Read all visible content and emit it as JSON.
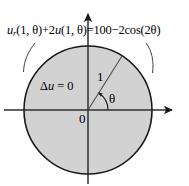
{
  "figure": {
    "type": "math-diagram",
    "canvas": {
      "width": 189,
      "height": 186,
      "background": "#ffffff"
    },
    "colors": {
      "disk_fill": "#d2d2d2",
      "stroke": "#1a1a1a",
      "axis": "#3a3a3a",
      "text": "#000000"
    }
  },
  "equation": {
    "full_text": "u_r(1, θ)+2u(1, θ)=100−2cos(2θ)",
    "parts": {
      "u1": "u",
      "subscript_r": "r",
      "args1": "(1, ",
      "theta1": "θ",
      "close1": ")+2",
      "u2": "u",
      "args2": "(1, ",
      "theta2": "θ",
      "close2": ")=100−2cos(2",
      "theta3": "θ",
      "close3": ")"
    }
  },
  "interior": {
    "laplace_delta": "Δ",
    "laplace_var": "u",
    "laplace_rest": " = 0",
    "full_text": "Δu = 0"
  },
  "labels": {
    "radius": "1",
    "angle": "θ",
    "origin": "0"
  },
  "geometry": {
    "circle": {
      "cx": 88,
      "cy": 110,
      "r": 64
    },
    "radius_line": {
      "x1": 88,
      "y1": 110,
      "x2": 122,
      "y2": 56,
      "angle_deg": 58
    },
    "x_axis": {
      "x1": 4,
      "y1": 110,
      "x2": 178,
      "y2": 110
    },
    "y_axis": {
      "x1": 88,
      "y1": 183,
      "x2": 88,
      "y2": 8
    },
    "angle_arc": {
      "cx": 88,
      "cy": 110,
      "r": 20,
      "start_deg": 0,
      "end_deg": 58
    }
  },
  "leaders": [
    {
      "name": "left-leader",
      "from": [
        33,
        44
      ],
      "to": [
        25,
        73
      ]
    },
    {
      "name": "right-leader",
      "from": [
        148,
        44
      ],
      "to": [
        152,
        74
      ]
    }
  ]
}
